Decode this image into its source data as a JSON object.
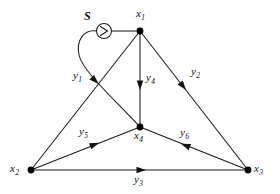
{
  "figure": {
    "background_color": "#ffffff",
    "stroke_color": "#1a1a1a",
    "node_color": "#000000",
    "width": 280,
    "height": 194
  },
  "source": {
    "label": "S",
    "symbol_name": "source-arrow-circle",
    "x": 104,
    "y": 31
  },
  "nodes": [
    {
      "id": "x1",
      "label": "x",
      "sub": "1",
      "x": 140,
      "y": 31,
      "label_x": 136,
      "label_y": 8
    },
    {
      "id": "x2",
      "label": "x",
      "sub": "2",
      "x": 31,
      "y": 170,
      "label_x": 10,
      "label_y": 163
    },
    {
      "id": "x3",
      "label": "x",
      "sub": "3",
      "x": 248,
      "y": 170,
      "label_x": 254,
      "label_y": 163
    },
    {
      "id": "x4",
      "label": "x",
      "sub": "4",
      "x": 140,
      "y": 127,
      "label_x": 134,
      "label_y": 130
    }
  ],
  "branches": [
    {
      "id": "y1",
      "label": "y",
      "sub": "1",
      "from": "S",
      "to": "x4",
      "label_x": 73,
      "label_y": 70,
      "arrow_direction": "down-right"
    },
    {
      "id": "y2",
      "label": "y",
      "sub": "2",
      "from": "x1",
      "to": "x3",
      "label_x": 191,
      "label_y": 66,
      "arrow_direction": "down-right"
    },
    {
      "id": "y3",
      "label": "y",
      "sub": "3",
      "from": "x2",
      "to": "x3",
      "label_x": 134,
      "label_y": 174,
      "arrow_direction": "right"
    },
    {
      "id": "y4",
      "label": "y",
      "sub": "4",
      "from": "x1",
      "to": "x4",
      "label_x": 146,
      "label_y": 72,
      "arrow_direction": "down"
    },
    {
      "id": "y5",
      "label": "y",
      "sub": "5",
      "from": "x2",
      "to": "x4",
      "label_x": 79,
      "label_y": 126,
      "arrow_direction": "up-right"
    },
    {
      "id": "y6",
      "label": "y",
      "sub": "6",
      "from": "x3",
      "to": "x4",
      "label_x": 180,
      "label_y": 127,
      "arrow_direction": "left"
    }
  ],
  "edges_extra": [
    {
      "id": "x2-x1",
      "from": "x2",
      "to": "x1",
      "label": ""
    }
  ]
}
